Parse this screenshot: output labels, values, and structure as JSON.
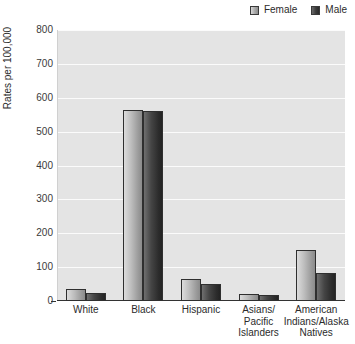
{
  "chart_data": {
    "type": "bar",
    "title": "",
    "subtitle": "",
    "xlabel": "",
    "ylabel": "Rates per 100,000",
    "ylim": [
      0,
      800
    ],
    "yticks": [
      0,
      100,
      200,
      300,
      400,
      500,
      600,
      700,
      800
    ],
    "ytick_labels": [
      "0",
      "100",
      "200",
      "300",
      "400",
      "500",
      "600",
      "700",
      "800"
    ],
    "grid": true,
    "legend_position": "top-right",
    "categories": [
      "White",
      "Black",
      "Hispanic",
      "Asians/ Pacific Islanders",
      "American Indians/Alaska Natives"
    ],
    "category_lines": [
      [
        "White"
      ],
      [
        "Black"
      ],
      [
        "Hispanic"
      ],
      [
        "Asians/",
        "Pacific",
        "Islanders"
      ],
      [
        "American",
        "Indians/Alaska",
        "Natives"
      ]
    ],
    "series": [
      {
        "name": "Female",
        "color": "#b4b4b4",
        "values": [
          36,
          565,
          65,
          20,
          152
        ]
      },
      {
        "name": "Male",
        "color": "#2f2f2f",
        "values": [
          25,
          560,
          50,
          17,
          82
        ]
      }
    ]
  },
  "legend": {
    "items": [
      {
        "label": "Female",
        "swatch": "female-swatch"
      },
      {
        "label": "Male",
        "swatch": "male-swatch"
      }
    ]
  },
  "axes": {
    "y_title": "Rates per 100,000"
  }
}
